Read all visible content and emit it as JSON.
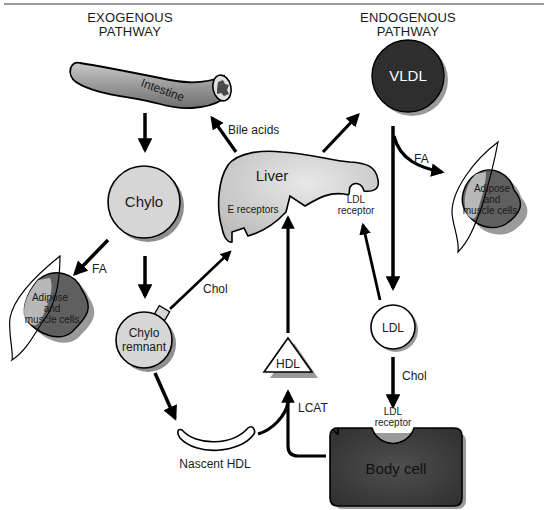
{
  "headers": {
    "exogenous_line1": "EXOGENOUS",
    "exogenous_line2": "PATHWAY",
    "endogenous_line1": "ENDOGENOUS",
    "endogenous_line2": "PATHWAY"
  },
  "nodes": {
    "intestine": "Intestine",
    "chylo": "Chylo",
    "chylo_remnant_line1": "Chylo",
    "chylo_remnant_line2": "remnant",
    "liver": "Liver",
    "e_receptors": "E receptors",
    "liver_ldl_receptor_line1": "LDL",
    "liver_ldl_receptor_line2": "receptor",
    "vldl": "VLDL",
    "ldl": "LDL",
    "hdl": "HDL",
    "nascent_hdl": "Nascent HDL",
    "body_cell": "Body cell",
    "body_ldl_receptor_line1": "LDL",
    "body_ldl_receptor_line2": "receptor",
    "adipose_left_line1": "Adipose",
    "adipose_left_line2": "and",
    "adipose_left_line3": "muscle cells",
    "adipose_right_line1": "Adipose",
    "adipose_right_line2": "and",
    "adipose_right_line3": "muscle cells"
  },
  "edges": {
    "bile_acids": "Bile acids",
    "fa_left": "FA",
    "fa_right": "FA",
    "chol_remnant_to_liver": "Chol",
    "chol_ldl_to_body": "Chol",
    "lcat": "LCAT"
  },
  "colors": {
    "light_gray": "#d4d4d4",
    "mid_gray": "#8a8a8a",
    "dark_gray": "#3a3a3a",
    "vldl_fill": "#2e2e2e",
    "body_cell_fill": "#3c3c3c",
    "shadow": "#9a9a9a",
    "line": "#000000"
  }
}
